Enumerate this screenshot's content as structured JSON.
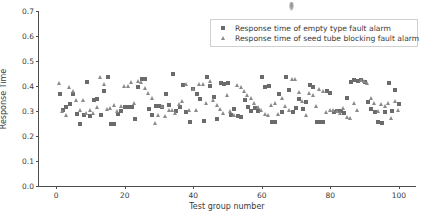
{
  "chart": {
    "type": "scatter",
    "title": "",
    "xlabel": "Test group number",
    "ylabel": "Response Time",
    "xticks": [
      "0",
      "20",
      "40",
      "60",
      "80",
      "100"
    ],
    "yticks": [
      "0.0",
      "0.1",
      "0.2",
      "0.3",
      "0.4",
      "0.5",
      "0.6",
      "0.7"
    ],
    "legend": {
      "position": "upper center",
      "entries": [
        {
          "label": "Response time of empty type fault alarm",
          "marker": "square",
          "color": "#6b6b6b"
        },
        {
          "label": "Response time of seed tube blocking fault alarm",
          "marker": "triangle",
          "color": "#8a8a8a"
        }
      ]
    }
  },
  "chart_data": {
    "type": "scatter",
    "title": "",
    "xlabel": "Test group number",
    "ylabel": "Response Time",
    "xlim": [
      -5,
      105
    ],
    "ylim": [
      0.0,
      0.7
    ],
    "xticks": [
      0,
      20,
      40,
      60,
      80,
      100
    ],
    "yticks": [
      0.0,
      0.1,
      0.2,
      0.3,
      0.4,
      0.5,
      0.6,
      0.7
    ],
    "grid": false,
    "legend_position": "upper center",
    "series": [
      {
        "name": "Response time of empty type fault alarm",
        "marker": "square",
        "color": "#6b6b6b",
        "x": [
          1,
          2,
          3,
          4,
          5,
          6,
          7,
          8,
          9,
          10,
          11,
          12,
          13,
          14,
          15,
          16,
          17,
          18,
          19,
          20,
          21,
          22,
          23,
          24,
          25,
          26,
          27,
          28,
          29,
          30,
          31,
          32,
          33,
          34,
          35,
          36,
          37,
          38,
          39,
          40,
          41,
          42,
          43,
          44,
          45,
          46,
          47,
          48,
          49,
          50,
          51,
          52,
          53,
          54,
          55,
          56,
          57,
          58,
          59,
          60,
          61,
          62,
          63,
          64,
          65,
          66,
          67,
          68,
          69,
          70,
          71,
          72,
          73,
          74,
          75,
          76,
          77,
          78,
          79,
          80,
          81,
          82,
          83,
          84,
          85,
          86,
          87,
          88,
          89,
          90,
          91,
          92,
          93,
          94,
          95,
          96,
          97,
          98,
          99,
          100
        ],
        "y": [
          0.37,
          0.305,
          0.315,
          0.33,
          0.37,
          0.29,
          0.25,
          0.285,
          0.418,
          0.28,
          0.345,
          0.35,
          0.285,
          0.38,
          0.435,
          0.25,
          0.248,
          0.29,
          0.3,
          0.315,
          0.318,
          0.315,
          0.268,
          0.395,
          0.43,
          0.428,
          0.31,
          0.283,
          0.322,
          0.32,
          0.315,
          0.368,
          0.325,
          0.448,
          0.3,
          0.318,
          0.406,
          0.296,
          0.258,
          0.39,
          0.37,
          0.348,
          0.262,
          0.435,
          0.4,
          0.355,
          0.268,
          0.412,
          0.409,
          0.413,
          0.284,
          0.31,
          0.282,
          0.278,
          0.345,
          0.318,
          0.3,
          0.312,
          0.302,
          0.435,
          0.396,
          0.399,
          0.258,
          0.258,
          0.37,
          0.296,
          0.436,
          0.384,
          0.295,
          0.312,
          0.348,
          0.31,
          0.335,
          0.403,
          0.398,
          0.255,
          0.258,
          0.258,
          0.38,
          0.374,
          0.296,
          0.302,
          0.3,
          0.291,
          0.352,
          0.418,
          0.424,
          0.42,
          0.424,
          0.418,
          0.336,
          0.309,
          0.298,
          0.255,
          0.252,
          0.295,
          0.412,
          0.3,
          0.384,
          0.33
        ]
      },
      {
        "name": "Response time of seed tube blocking fault alarm",
        "marker": "triangle",
        "color": "#8a8a8a",
        "x": [
          1,
          2,
          3,
          4,
          5,
          6,
          7,
          8,
          9,
          10,
          11,
          12,
          13,
          14,
          15,
          16,
          17,
          18,
          19,
          20,
          21,
          22,
          23,
          24,
          25,
          26,
          27,
          28,
          29,
          30,
          31,
          32,
          33,
          34,
          35,
          36,
          37,
          38,
          39,
          40,
          41,
          42,
          43,
          44,
          45,
          46,
          47,
          48,
          49,
          50,
          51,
          52,
          53,
          54,
          55,
          56,
          57,
          58,
          59,
          60,
          61,
          62,
          63,
          64,
          65,
          66,
          67,
          68,
          69,
          70,
          71,
          72,
          73,
          74,
          75,
          76,
          77,
          78,
          79,
          80,
          81,
          82,
          83,
          84,
          85,
          86,
          87,
          88,
          89,
          90,
          91,
          92,
          93,
          94,
          95,
          96,
          97,
          98,
          99,
          100
        ],
        "y": [
          0.408,
          0.296,
          0.282,
          0.395,
          0.378,
          0.34,
          0.3,
          0.34,
          0.288,
          0.3,
          0.29,
          0.315,
          0.435,
          0.405,
          0.306,
          0.31,
          0.322,
          0.298,
          0.318,
          0.398,
          0.396,
          0.415,
          0.33,
          0.418,
          0.412,
          0.388,
          0.368,
          0.35,
          0.248,
          0.282,
          0.316,
          0.278,
          0.302,
          0.3,
          0.29,
          0.325,
          0.338,
          0.404,
          0.3,
          0.384,
          0.3,
          0.406,
          0.405,
          0.33,
          0.416,
          0.34,
          0.322,
          0.306,
          0.29,
          0.36,
          0.298,
          0.282,
          0.4,
          0.392,
          0.376,
          0.36,
          0.348,
          0.33,
          0.312,
          0.302,
          0.286,
          0.28,
          0.32,
          0.33,
          0.286,
          0.348,
          0.318,
          0.3,
          0.424,
          0.426,
          0.374,
          0.338,
          0.28,
          0.37,
          0.36,
          0.318,
          0.386,
          0.376,
          0.295,
          0.3,
          0.302,
          0.298,
          0.29,
          0.308,
          0.274,
          0.268,
          0.33,
          0.3,
          0.42,
          0.418,
          0.41,
          0.35,
          0.33,
          0.298,
          0.325,
          0.318,
          0.33,
          0.27,
          0.338,
          0.3
        ]
      }
    ]
  }
}
